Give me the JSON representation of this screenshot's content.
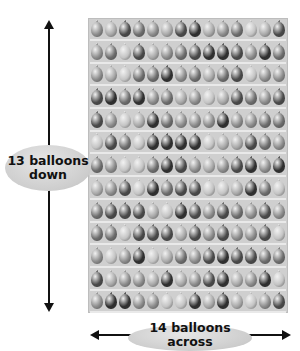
{
  "diagram": {
    "rows": 13,
    "columns": 14,
    "labels": {
      "vertical": "13 balloons down",
      "vertical_line1": "13 balloons",
      "vertical_line2": "down",
      "horizontal": "14 balloons across"
    },
    "colors": {
      "panel": "#cfcfcf",
      "shelf": "#e9e9e9",
      "arrow": "#111111",
      "oval": "#d4d4d4",
      "balloon_shades": [
        "#4a4a4a",
        "#6e6e6e",
        "#8c8c8c",
        "#a8a8a8",
        "#c4c4c4",
        "#2f2f2f"
      ]
    }
  }
}
